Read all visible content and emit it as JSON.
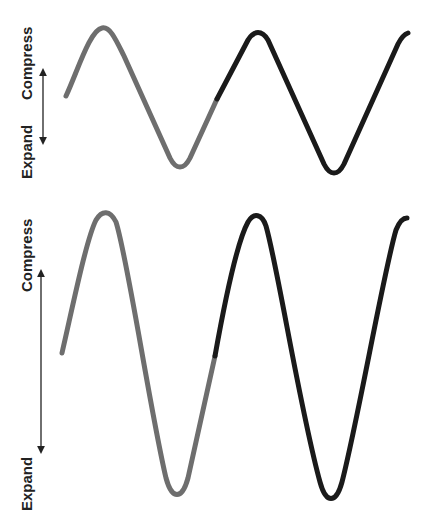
{
  "diagram": {
    "top_panel": {
      "compress_label": "Compress",
      "expand_label": "Expand",
      "amplitude": "low"
    },
    "bottom_panel": {
      "compress_label": "Compress",
      "expand_label": "Expand",
      "amplitude": "high"
    },
    "colors": {
      "first_cycle": "#6e6e6e",
      "second_cycle": "#1a1a1a",
      "arrow": "#222222",
      "text": "#222222"
    }
  }
}
